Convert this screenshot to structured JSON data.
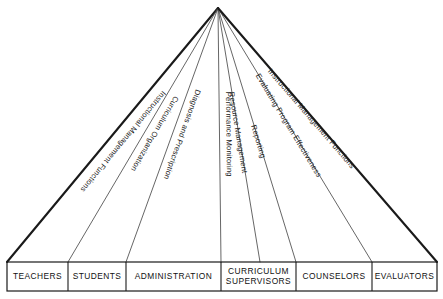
{
  "diagram": {
    "title": "Instructional Management Functions",
    "apex": {
      "x": 218,
      "y": 8
    },
    "baseline_y": 262,
    "box_row": {
      "top": 262,
      "bottom": 291,
      "left": 7,
      "right": 437
    },
    "colors": {
      "background": "#ffffff",
      "line_outer": "#1a1a1a",
      "line_inner": "#4a4a4a",
      "box_border": "#1a1a1a",
      "text": "#111111"
    },
    "rays": [
      {
        "label": "Instructional Management Functions",
        "weight": "thick",
        "end_x": 7,
        "label_offset": 10,
        "label_start": 0.3
      },
      {
        "label": "Curriculum Organization",
        "weight": "thin",
        "end_x": 68,
        "label_offset": 7,
        "label_start": 0.33
      },
      {
        "label": "Diagnosis and Prescription",
        "weight": "thin",
        "end_x": 126,
        "label_offset": 7,
        "label_start": 0.31
      },
      {
        "label": "Performance Monitoring",
        "weight": "thin",
        "end_x": 221,
        "label_offset": 7,
        "label_start": 0.33
      },
      {
        "label": "Resource Management",
        "weight": "thin",
        "end_x": 260,
        "label_offset": -3,
        "label_start": 0.33
      },
      {
        "label": "Reporting",
        "weight": "thin",
        "end_x": 296,
        "label_offset": -3,
        "label_start": 0.46
      },
      {
        "label": "Evaluating Program Effectiveness",
        "weight": "thin",
        "end_x": 372,
        "label_offset": -3,
        "label_start": 0.26
      },
      {
        "label": "Instructional Management Functions",
        "weight": "thick",
        "end_x": 437,
        "label_offset": -4,
        "label_start": 0.24
      }
    ],
    "boxes": [
      {
        "label": "TEACHERS",
        "lines": [
          "TEACHERS"
        ],
        "x0": 7,
        "x1": 68
      },
      {
        "label": "STUDENTS",
        "lines": [
          "STUDENTS"
        ],
        "x0": 68,
        "x1": 126
      },
      {
        "label": "ADMINISTRATION",
        "lines": [
          "ADMINISTRATION"
        ],
        "x0": 126,
        "x1": 221
      },
      {
        "label": "CURRICULUM SUPERVISORS",
        "lines": [
          "CURRICULUM",
          "SUPERVISORS"
        ],
        "x0": 221,
        "x1": 296
      },
      {
        "label": "COUNSELORS",
        "lines": [
          "COUNSELORS"
        ],
        "x0": 296,
        "x1": 372
      },
      {
        "label": "EVALUATORS",
        "lines": [
          "EVALUATORS"
        ],
        "x0": 372,
        "x1": 437
      }
    ],
    "bottom_caption": ""
  }
}
